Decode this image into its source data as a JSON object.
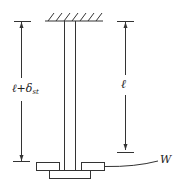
{
  "diagram": {
    "type": "hanging rod with attached weight (static elongation)",
    "labels": {
      "total_length": "ℓ+δ",
      "total_length_subscript": "st",
      "original_length": "ℓ",
      "weight": "W"
    },
    "colors": {
      "stroke": "#333333",
      "background": "#ffffff"
    }
  }
}
